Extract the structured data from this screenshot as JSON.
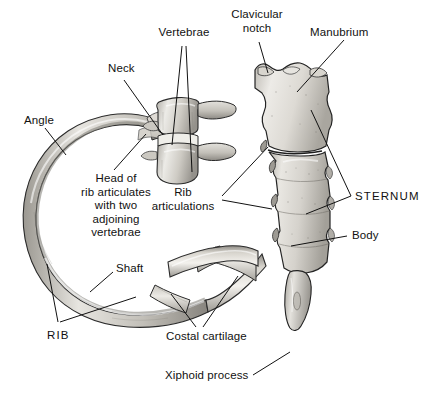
{
  "figure": {
    "background_color": "#ffffff",
    "line_color": "#111111",
    "bone_light": "#e9e7e2",
    "bone_mid": "#c9c6bf",
    "bone_dark": "#8f8c86",
    "width": 423,
    "height": 398
  },
  "labels": {
    "vertebrae": "Vertebrae",
    "clavicular_notch": "Clavicular\nnotch",
    "manubrium": "Manubrium",
    "neck": "Neck",
    "angle": "Angle",
    "head_of_rib": "Head of\nrib articulates\nwith two\nadjoining\nvertebrae",
    "rib_articulations": "Rib\narticulations",
    "sternum": "STERNUM",
    "body": "Body",
    "shaft": "Shaft",
    "rib": "RIB",
    "costal_cartilage": "Costal cartilage",
    "xiphoid_process": "Xiphoid process"
  },
  "structures": [
    {
      "name": "rib",
      "label": "RIB"
    },
    {
      "name": "rib-shaft",
      "label": "Shaft"
    },
    {
      "name": "rib-angle",
      "label": "Angle"
    },
    {
      "name": "rib-neck",
      "label": "Neck"
    },
    {
      "name": "rib-head",
      "label": "Head of rib articulates with two adjoining vertebrae"
    },
    {
      "name": "vertebrae",
      "label": "Vertebrae"
    },
    {
      "name": "costal-cartilage",
      "label": "Costal cartilage"
    },
    {
      "name": "sternum",
      "label": "STERNUM"
    },
    {
      "name": "manubrium",
      "label": "Manubrium"
    },
    {
      "name": "clavicular-notch",
      "label": "Clavicular notch"
    },
    {
      "name": "sternum-body",
      "label": "Body"
    },
    {
      "name": "rib-articulations",
      "label": "Rib articulations"
    },
    {
      "name": "xiphoid-process",
      "label": "Xiphoid process"
    }
  ]
}
